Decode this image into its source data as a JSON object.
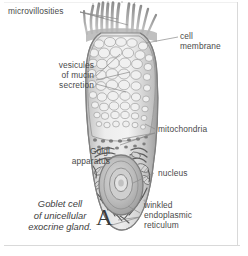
{
  "figure": {
    "panel_letter": "A",
    "caption": "Goblet cell\nof unicellular\nexocrine gland.",
    "background_color": "#ffffff",
    "label_color": "#4a4a4a",
    "leader_color": "#6e6e6e",
    "frame_color": "#d9d9d9"
  },
  "labels": {
    "microvillosities": "microvillosities",
    "cell_membrane": "cell\nmembrane",
    "vesicles_of_mucin_secretion": "vesicules\nof mucin\nsecretion",
    "mitochondria": "mitochondria",
    "golgi_apparatus": "Golgi\napparatus",
    "nucleus": "nucleus",
    "winkled_endoplasmic_reticulum": "winkled\nendoplasmic\nreticulum"
  },
  "structures": [
    {
      "name": "microvilli",
      "description": "finger-like apical projections"
    },
    {
      "name": "cell-membrane",
      "description": "outer boundary of goblet cell"
    },
    {
      "name": "mucin-vesicles",
      "description": "round secretory granules filling apical theca"
    },
    {
      "name": "mitochondria",
      "description": "elongated organelles in basal cytoplasm"
    },
    {
      "name": "golgi-apparatus",
      "description": "stacked cisternae above nucleus"
    },
    {
      "name": "nucleus",
      "description": "basal oval nucleus with nucleolus"
    },
    {
      "name": "endoplasmic-reticulum",
      "description": "wrinkled rough ER around nucleus"
    }
  ]
}
